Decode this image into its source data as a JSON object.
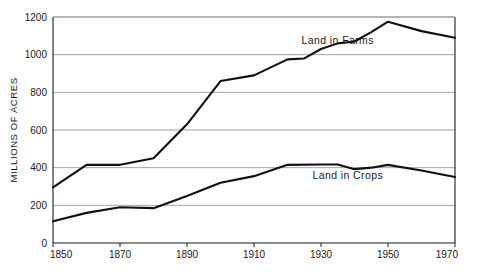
{
  "chart_data": {
    "type": "line",
    "title": "",
    "xlabel": "",
    "ylabel": "MILLIONS OF ACRES",
    "xlim": [
      1850,
      1970
    ],
    "ylim": [
      0,
      1200
    ],
    "grid": true,
    "legend_position": "inline-right",
    "x_ticks": [
      "1850",
      "1870",
      "1890",
      "1910",
      "1930",
      "1950",
      "1970"
    ],
    "y_ticks": [
      "0",
      "200",
      "400",
      "600",
      "800",
      "1000",
      "1200"
    ],
    "x_tick_values": [
      1850,
      1870,
      1890,
      1910,
      1930,
      1950,
      1970
    ],
    "y_tick_values": [
      0,
      200,
      400,
      600,
      800,
      1000,
      1200
    ],
    "series": [
      {
        "name": "Land in Farms",
        "color": "#111111",
        "label_x": 1935,
        "label_y": 1055,
        "x": [
          1850,
          1860,
          1870,
          1880,
          1890,
          1900,
          1910,
          1920,
          1925,
          1930,
          1935,
          1940,
          1945,
          1950,
          1960,
          1970
        ],
        "values": [
          295,
          415,
          415,
          450,
          630,
          860,
          890,
          975,
          980,
          1030,
          1060,
          1070,
          1120,
          1175,
          1125,
          1090
        ]
      },
      {
        "name": "Land in Crops",
        "color": "#111111",
        "label_x": 1938,
        "label_y": 340,
        "x": [
          1850,
          1860,
          1870,
          1880,
          1890,
          1900,
          1910,
          1920,
          1930,
          1935,
          1940,
          1945,
          1950,
          1960,
          1970
        ],
        "values": [
          115,
          160,
          190,
          185,
          250,
          320,
          355,
          415,
          417,
          417,
          392,
          400,
          415,
          385,
          350
        ]
      }
    ]
  },
  "axis": {
    "y_title": "MILLIONS OF ACRES"
  },
  "colors": {
    "line": "#111111",
    "grid": "#8c8c8c",
    "axis": "#1a1a1a",
    "background": "#ffffff"
  }
}
